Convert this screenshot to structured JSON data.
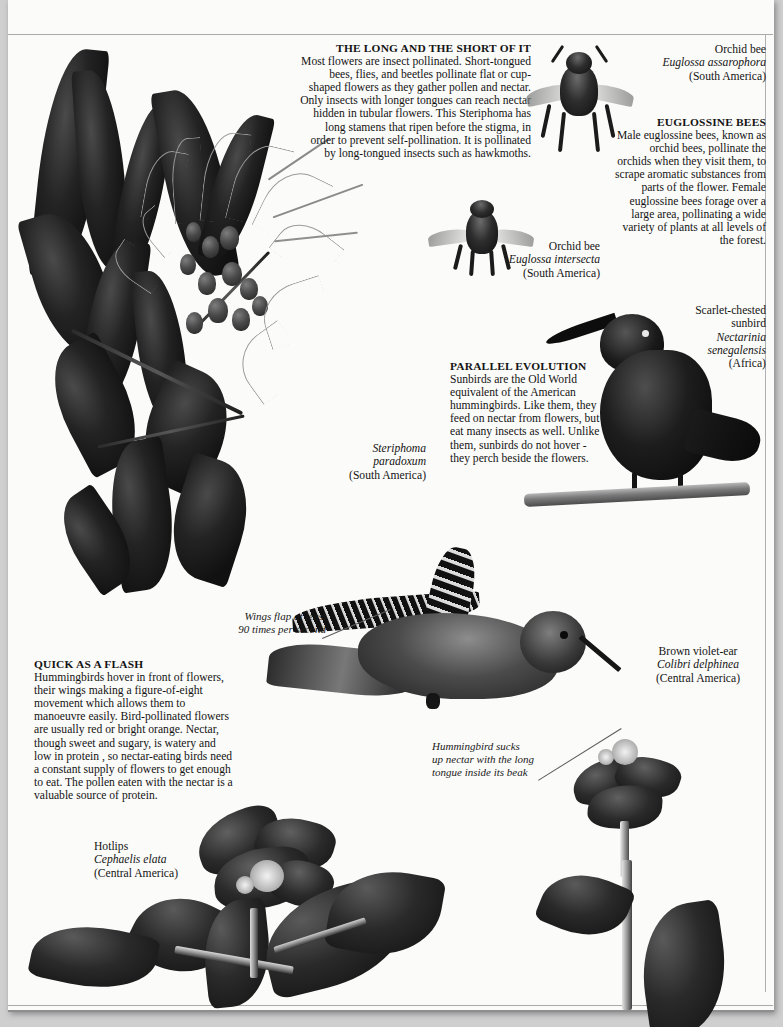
{
  "articles": [
    {
      "id": "long-and-short",
      "heading": "THE LONG AND THE SHORT OF IT",
      "body": "Most flowers are insect pollinated. Short-tongued bees, flies, and beetles pollinate flat or cup-shaped flowers as they gather pollen and nectar. Only insects with longer tongues can reach nectar hidden in tubular flowers. This Steriphoma has long stamens that ripen before the stigma, in order to prevent self-pollination. It is pollinated by long-tongued insects such as hawkmoths."
    },
    {
      "id": "euglossine-bees",
      "heading": "EUGLOSSINE BEES",
      "body": "Male euglossine bees, known as orchid bees, pollinate the orchids when they visit them, to scrape aromatic substances from parts of the flower. Female euglossine bees forage over a large area, pollinating a wide variety of plants at all levels of the forest."
    },
    {
      "id": "parallel-evolution",
      "heading": "PARALLEL EVOLUTION",
      "body": "Sunbirds are the Old World equivalent of the American hummingbirds. Like them, they feed on nectar from flowers, but eat many insects as well. Unlike them, sunbirds do not hover - they perch beside the flowers."
    },
    {
      "id": "quick-as-a-flash",
      "heading": "QUICK AS A FLASH",
      "body": "Hummingbirds hover in front of flowers, their wings making a figure-of-eight movement which allows them to manoeuvre easily. Bird-pollinated flowers are usually red or bright orange. Nectar, though sweet and sugary, is watery and low in protein , so nectar-eating birds need a constant supply of flowers to get enough to eat. The pollen eaten with the nectar is a valuable source of protein."
    }
  ],
  "captions": [
    {
      "id": "orchid-bee-assarophora",
      "common": "Orchid bee",
      "species": "Euglossa assarophora",
      "region": "(South America)"
    },
    {
      "id": "orchid-bee-intersecta",
      "common": "Orchid bee",
      "species": "Euglossa intersecta",
      "region": "(South America)"
    },
    {
      "id": "scarlet-chested-sunbird",
      "common_line1": "Scarlet-chested",
      "common_line2": "sunbird",
      "species_line1": "Nectarinia",
      "species_line2": "senegalensis",
      "region": "(Africa)"
    },
    {
      "id": "steriphoma",
      "species_line1": "Steriphoma",
      "species_line2": "paradoxum",
      "region": "(South America)"
    },
    {
      "id": "brown-violet-ear",
      "common": "Brown violet-ear",
      "species": "Colibri delphinea",
      "region": "(Central America)"
    },
    {
      "id": "hotlips",
      "common": "Hotlips",
      "species": "Cephaelis elata",
      "region": "(Central America)"
    }
  ],
  "annotations": [
    {
      "id": "wings-flap",
      "line1": "Wings flap at least",
      "line2": "90 times per second"
    },
    {
      "id": "hummingbird-sucks",
      "line1": "Hummingbird sucks",
      "line2": "up nectar with the long",
      "line3": "tongue inside its beak"
    }
  ],
  "colors": {
    "paper": "#fbfbf9",
    "ink": "#141414",
    "rule": "#a9a9a9",
    "backdrop": "#cfcfcf"
  }
}
